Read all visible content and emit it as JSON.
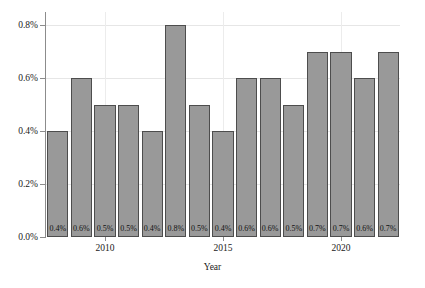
{
  "chart_data": {
    "type": "bar",
    "title": "",
    "subtitle": "",
    "xlabel": "Year",
    "ylabel": "",
    "categories": [
      2008,
      2009,
      2010,
      2011,
      2012,
      2013,
      2014,
      2015,
      2016,
      2017,
      2018,
      2019,
      2020,
      2021,
      2022
    ],
    "values": [
      0.4,
      0.6,
      0.5,
      0.5,
      0.4,
      0.8,
      0.5,
      0.4,
      0.6,
      0.6,
      0.5,
      0.7,
      0.7,
      0.6,
      0.7
    ],
    "bar_labels": [
      "0.4%",
      "0.6%",
      "0.5%",
      "0.5%",
      "0.4%",
      "0.8%",
      "0.5%",
      "0.4%",
      "0.6%",
      "0.6%",
      "0.5%",
      "0.7%",
      "0.7%",
      "0.6%",
      "0.7%"
    ],
    "ylim": [
      0.0,
      0.85
    ],
    "y_ticks": [
      0.0,
      0.2,
      0.4,
      0.6,
      0.8
    ],
    "y_tick_labels": [
      "0.0%",
      "0.2%",
      "0.4%",
      "0.6%",
      "0.8%"
    ],
    "x_ticks": [
      2010,
      2015,
      2020
    ],
    "x_tick_labels": [
      "2010",
      "2015",
      "2020"
    ],
    "grid": true,
    "legend": null,
    "bar_color": "#999999",
    "bar_edge_color": "#4d4d4d",
    "grid_color": "#e6e6e6",
    "background_color": "#ffffff"
  }
}
